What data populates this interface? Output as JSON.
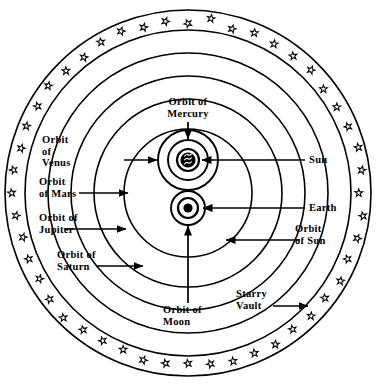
{
  "diagram": {
    "type": "astronomical-schematic",
    "background_color": "#ffffff",
    "line_color": "#000000",
    "center": {
      "x": 188,
      "y": 193
    },
    "labels": {
      "orbit_of_mercury": "Orbit of\nMercury",
      "orbit_of_venus": "Orbit\nof\nVenus",
      "orbit_of_mars": "Orbit\nof Mars",
      "orbit_of_jupiter": "Orbit of\nJupiter",
      "orbit_of_saturn": "Orbit of\nSaturn",
      "orbit_of_moon": "Orbit of\nMoon",
      "orbit_of_sun": "Orbit\nof Sun",
      "sun": "Sun",
      "earth": "Earth",
      "starry_vault": "Starry\nVault"
    },
    "bodies": [
      {
        "name": "sun",
        "label": "Sun",
        "cx": 188,
        "cy": 160,
        "symbol": "sun-glyph"
      },
      {
        "name": "earth",
        "label": "Earth",
        "cx": 188,
        "cy": 208,
        "symbol": "earth-dot"
      }
    ],
    "orbit_circles": [
      {
        "name": "starry-vault-outer",
        "cx": 188,
        "cy": 193,
        "r": 183
      },
      {
        "name": "starry-vault-inner",
        "cx": 188,
        "cy": 193,
        "r": 163
      },
      {
        "name": "orbit-of-saturn",
        "cx": 188,
        "cy": 193,
        "r": 140
      },
      {
        "name": "orbit-of-jupiter",
        "cx": 188,
        "cy": 193,
        "r": 117
      },
      {
        "name": "orbit-of-mars",
        "cx": 188,
        "cy": 193,
        "r": 94
      },
      {
        "name": "orbit-of-sun",
        "cx": 188,
        "cy": 193,
        "r": 64
      },
      {
        "name": "orbit-of-venus",
        "cx": 188,
        "cy": 160,
        "r": 30
      },
      {
        "name": "orbit-of-mercury",
        "cx": 188,
        "cy": 160,
        "r": 20
      },
      {
        "name": "orbit-of-moon",
        "cx": 188,
        "cy": 208,
        "r": 17
      }
    ],
    "star_ring": {
      "name": "starry-vault-stars",
      "count": 48,
      "radius": 173,
      "star_size": 7
    }
  }
}
